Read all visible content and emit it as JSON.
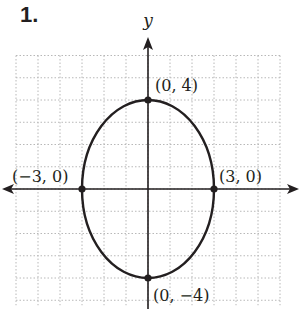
{
  "problem": {
    "number": "1."
  },
  "chart_data": {
    "type": "line",
    "title": "",
    "xlabel": "",
    "ylabel": "y",
    "xlim": [
      -6,
      6
    ],
    "ylim": [
      -5,
      6
    ],
    "grid": true,
    "curve": {
      "shape": "ellipse",
      "center": [
        0,
        0
      ],
      "semi_axis_x": 3,
      "semi_axis_y": 4,
      "equation": "x^2/9 + y^2/16 = 1"
    },
    "points": [
      {
        "x": 0,
        "y": 4,
        "label": "(0, 4)"
      },
      {
        "x": -3,
        "y": 0,
        "label": "(−3, 0)"
      },
      {
        "x": 3,
        "y": 0,
        "label": "(3, 0)"
      },
      {
        "x": 0,
        "y": -4,
        "label": "(0, −4)"
      }
    ]
  },
  "style": {
    "ink": "#231f20",
    "grid": "#b8b8b8"
  }
}
